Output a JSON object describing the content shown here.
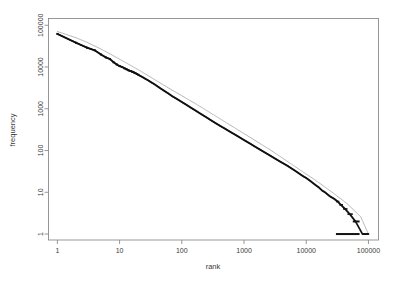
{
  "figure": {
    "background_color": "#ffffff",
    "data_color": "#111111",
    "fit_color": "#a8a8a8",
    "frame_color": "#8c8c8c"
  },
  "chart_data": {
    "type": "scatter",
    "title": "",
    "subtitle": "",
    "xlabel": "rank",
    "ylabel": "frequency",
    "xscale": "log",
    "yscale": "log",
    "xlim": [
      0.72,
      145000
    ],
    "ylim": [
      0.72,
      145000
    ],
    "grid": false,
    "legend": null,
    "xticks": [
      1,
      10,
      100,
      1000,
      10000,
      100000
    ],
    "xticklabels": [
      "1",
      "10",
      "100",
      "1000",
      "10000",
      "100000"
    ],
    "yticks": [
      1,
      10,
      100,
      1000,
      10000,
      100000
    ],
    "yticklabels": [
      "1",
      "10",
      "100",
      "1000",
      "10000",
      "100000"
    ],
    "series": [
      {
        "name": "observed rank-frequency",
        "marker": "point",
        "color": "#111111",
        "points": [
          [
            1,
            62000
          ],
          [
            2,
            38000
          ],
          [
            3,
            29000
          ],
          [
            4,
            25000
          ],
          [
            5,
            20000
          ],
          [
            6,
            17000
          ],
          [
            7,
            15500
          ],
          [
            8,
            13000
          ],
          [
            9,
            11500
          ],
          [
            10,
            10500
          ],
          [
            11,
            10000
          ],
          [
            12,
            9300
          ],
          [
            13,
            8800
          ],
          [
            14,
            8300
          ],
          [
            15,
            8000
          ],
          [
            16,
            7700
          ],
          [
            17,
            7400
          ],
          [
            18,
            7100
          ],
          [
            19,
            6800
          ],
          [
            20,
            6500
          ],
          [
            22,
            6000
          ],
          [
            24,
            5600
          ],
          [
            26,
            5200
          ],
          [
            28,
            4900
          ],
          [
            30,
            4600
          ],
          [
            33,
            4200
          ],
          [
            36,
            3900
          ],
          [
            40,
            3500
          ],
          [
            45,
            3100
          ],
          [
            50,
            2800
          ],
          [
            55,
            2550
          ],
          [
            60,
            2350
          ],
          [
            70,
            2000
          ],
          [
            80,
            1780
          ],
          [
            90,
            1600
          ],
          [
            100,
            1450
          ],
          [
            120,
            1230
          ],
          [
            140,
            1060
          ],
          [
            160,
            940
          ],
          [
            180,
            840
          ],
          [
            200,
            760
          ],
          [
            250,
            620
          ],
          [
            300,
            520
          ],
          [
            400,
            400
          ],
          [
            500,
            330
          ],
          [
            600,
            280
          ],
          [
            700,
            245
          ],
          [
            800,
            218
          ],
          [
            900,
            196
          ],
          [
            1000,
            178
          ],
          [
            1200,
            152
          ],
          [
            1500,
            124
          ],
          [
            2000,
            96
          ],
          [
            2500,
            79
          ],
          [
            3000,
            67
          ],
          [
            4000,
            52
          ],
          [
            5000,
            43
          ],
          [
            6000,
            36
          ],
          [
            7000,
            31
          ],
          [
            8000,
            27
          ],
          [
            9000,
            24
          ],
          [
            10000,
            22
          ],
          [
            12000,
            18
          ],
          [
            14000,
            15
          ],
          [
            16000,
            13
          ],
          [
            18000,
            11
          ],
          [
            20000,
            10
          ],
          [
            24000,
            8
          ],
          [
            28000,
            7
          ],
          [
            32000,
            6
          ],
          [
            36000,
            5
          ],
          [
            42000,
            4
          ],
          [
            50000,
            3
          ],
          [
            62000,
            2
          ],
          [
            80000,
            1
          ],
          [
            100000,
            1
          ]
        ],
        "tail_plateaus": [
          {
            "frequency": 6,
            "rank_start": 30000,
            "rank_end": 34000
          },
          {
            "frequency": 5,
            "rank_start": 34000,
            "rank_end": 39000
          },
          {
            "frequency": 4,
            "rank_start": 39000,
            "rank_end": 46000
          },
          {
            "frequency": 3,
            "rank_start": 46000,
            "rank_end": 56000
          },
          {
            "frequency": 2,
            "rank_start": 56000,
            "rank_end": 72000
          },
          {
            "frequency": 1,
            "rank_start": 30000,
            "rank_end": 72000
          }
        ]
      },
      {
        "name": "fitted curve",
        "marker": "line",
        "color": "#a8a8a8",
        "points": [
          [
            1,
            71000
          ],
          [
            2,
            50000
          ],
          [
            3,
            39000
          ],
          [
            5,
            27000
          ],
          [
            8,
            18500
          ],
          [
            12,
            13200
          ],
          [
            20,
            8600
          ],
          [
            35,
            5200
          ],
          [
            60,
            3200
          ],
          [
            100,
            2050
          ],
          [
            180,
            1230
          ],
          [
            300,
            770
          ],
          [
            500,
            480
          ],
          [
            900,
            280
          ],
          [
            1500,
            175
          ],
          [
            2600,
            105
          ],
          [
            4500,
            61
          ],
          [
            8000,
            34
          ],
          [
            14000,
            19.5
          ],
          [
            25000,
            10.5
          ],
          [
            45000,
            5.4
          ],
          [
            75000,
            2.6
          ],
          [
            100000,
            1.0
          ]
        ]
      }
    ]
  },
  "axes": {
    "x_title": "rank",
    "y_title": "frequency"
  }
}
